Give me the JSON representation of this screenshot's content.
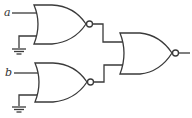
{
  "diagram": {
    "type": "logic-circuit",
    "inputs": [
      {
        "label": "a"
      },
      {
        "label": "b"
      }
    ],
    "gates": [
      {
        "id": "nor1",
        "type": "NOR",
        "inputs": [
          "a",
          "ground"
        ]
      },
      {
        "id": "nor2",
        "type": "NOR",
        "inputs": [
          "b",
          "ground"
        ]
      },
      {
        "id": "nor3",
        "type": "NOR",
        "inputs": [
          "nor1",
          "nor2"
        ]
      }
    ],
    "stroke_color": "#3a3a3a"
  }
}
